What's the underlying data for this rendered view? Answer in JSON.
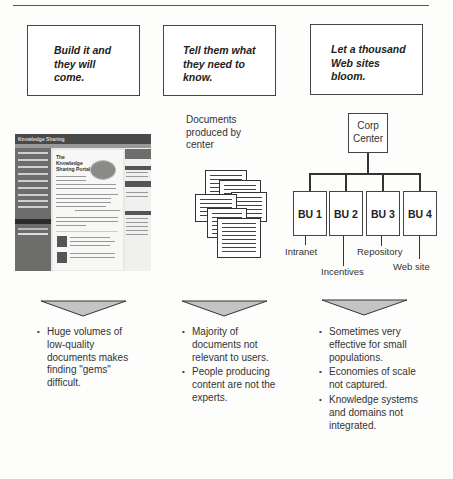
{
  "columns": [
    {
      "heading": "Build it and they will come.",
      "heading_lines": [
        "Build it and",
        "they will",
        "come."
      ],
      "visual": "knowledge-portal-screenshot",
      "bullets": [
        "Huge volumes of low-quality documents makes finding \"gems\" difficult."
      ]
    },
    {
      "heading": "Tell them what they need to know.",
      "heading_lines": [
        "Tell them what",
        "they need to",
        "know."
      ],
      "visual": "document-stack",
      "visual_label_lines": [
        "Documents",
        "produced by",
        "center"
      ],
      "bullets": [
        "Majority of documents not relevant to users.",
        "People producing content are not the experts."
      ]
    },
    {
      "heading": "Let a thousand Web sites bloom.",
      "heading_lines": [
        "Let a thousand",
        "Web sites",
        "bloom."
      ],
      "visual": "org-chart",
      "bullets": [
        "Sometimes very effective for small populations.",
        "Economies of scale not captured.",
        "Knowledge systems and domains not integrated."
      ]
    }
  ],
  "screenshot": {
    "banner": "Knowledge Sharing",
    "title_lines": [
      "The",
      "Knowledge",
      "Sharing Portal"
    ]
  },
  "org_chart": {
    "root_lines": [
      "Corp",
      "Center"
    ],
    "units": [
      "BU 1",
      "BU 2",
      "BU 3",
      "BU 4"
    ],
    "unit_labels": [
      "Intranet",
      "Incentives",
      "Repository",
      "Web site"
    ]
  },
  "colors": {
    "line": "#333333",
    "triangle_fill": "#c4c4c4",
    "border": "#444444"
  }
}
